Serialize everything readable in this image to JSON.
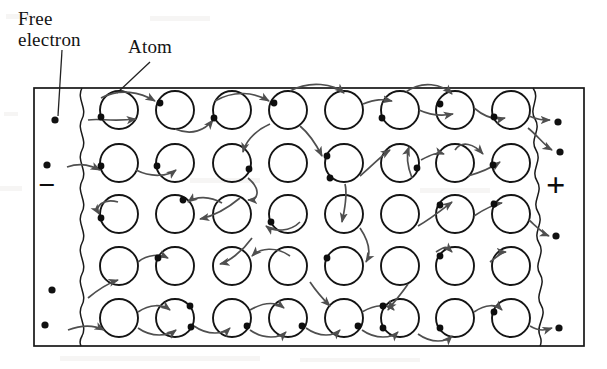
{
  "labels": {
    "free_electron": "Free\nelectron",
    "free_electron_line1": "Free",
    "free_electron_line2": "electron",
    "atom": "Atom"
  },
  "terminals": {
    "negative": "−",
    "positive": "+",
    "negative_name": "negative terminal",
    "positive_name": "positive terminal"
  },
  "colors": {
    "ink": "#141414",
    "line": "#1a1a1a",
    "arrow": "#4c4c4c",
    "background": "#ffffff",
    "paper_noise": "#b9b5ad"
  },
  "geometry": {
    "canvas": {
      "width": 607,
      "height": 369
    },
    "box": {
      "x": 34,
      "y": 88,
      "width": 550,
      "height": 258
    },
    "atom_radius": 19,
    "rows": 5,
    "columns": 8,
    "row_y": [
      110,
      163,
      214,
      266,
      318
    ],
    "col_x": [
      119,
      175,
      232,
      288,
      344,
      400,
      455,
      511
    ],
    "wavy_boundary_left_x": 82,
    "wavy_boundary_right_x": 535
  },
  "lattice": {
    "atom_count": 40,
    "atoms": [
      {
        "row": 0,
        "col": 0,
        "cx": 119,
        "cy": 110,
        "electron_angle": 200
      },
      {
        "row": 0,
        "col": 1,
        "cx": 175,
        "cy": 110,
        "electron_angle": 250
      },
      {
        "row": 0,
        "col": 2,
        "cx": 232,
        "cy": 110,
        "electron_angle": 200
      },
      {
        "row": 0,
        "col": 3,
        "cx": 288,
        "cy": 110,
        "electron_angle": 260
      },
      {
        "row": 0,
        "col": 4,
        "cx": 344,
        "cy": 110,
        "electron_angle": null
      },
      {
        "row": 0,
        "col": 5,
        "cx": 400,
        "cy": 110,
        "electron_angle": 205
      },
      {
        "row": 0,
        "col": 6,
        "cx": 455,
        "cy": 110,
        "electron_angle": 255
      },
      {
        "row": 0,
        "col": 7,
        "cx": 511,
        "cy": 110,
        "electron_angle": 195
      },
      {
        "row": 1,
        "col": 0,
        "cx": 119,
        "cy": 163,
        "electron_angle": 190
      },
      {
        "row": 1,
        "col": 1,
        "cx": 175,
        "cy": 163,
        "electron_angle": 190
      },
      {
        "row": 1,
        "col": 2,
        "cx": 232,
        "cy": 163,
        "electron_angle": 20
      },
      {
        "row": 1,
        "col": 3,
        "cx": 288,
        "cy": 163,
        "electron_angle": null
      },
      {
        "row": 1,
        "col": 4,
        "cx": 344,
        "cy": 163,
        "electron_angle": 160
      },
      {
        "row": 1,
        "col": 5,
        "cx": 400,
        "cy": 163,
        "electron_angle": 340
      },
      {
        "row": 1,
        "col": 6,
        "cx": 455,
        "cy": 163,
        "electron_angle": null
      },
      {
        "row": 1,
        "col": 7,
        "cx": 511,
        "cy": 163,
        "electron_angle": 185
      },
      {
        "row": 2,
        "col": 0,
        "cx": 119,
        "cy": 214,
        "electron_angle": 195
      },
      {
        "row": 2,
        "col": 1,
        "cx": 175,
        "cy": 214,
        "electron_angle": 290
      },
      {
        "row": 2,
        "col": 2,
        "cx": 232,
        "cy": 214,
        "electron_angle": null
      },
      {
        "row": 2,
        "col": 3,
        "cx": 288,
        "cy": 214,
        "electron_angle": 250
      },
      {
        "row": 2,
        "col": 4,
        "cx": 344,
        "cy": 214,
        "electron_angle": null
      },
      {
        "row": 2,
        "col": 5,
        "cx": 400,
        "cy": 214,
        "electron_angle": null
      },
      {
        "row": 2,
        "col": 6,
        "cx": 455,
        "cy": 214,
        "electron_angle": 215
      },
      {
        "row": 2,
        "col": 7,
        "cx": 511,
        "cy": 214,
        "electron_angle": 210
      },
      {
        "row": 3,
        "col": 0,
        "cx": 119,
        "cy": 266,
        "electron_angle": null
      },
      {
        "row": 3,
        "col": 1,
        "cx": 175,
        "cy": 266,
        "electron_angle": 200
      },
      {
        "row": 3,
        "col": 2,
        "cx": 232,
        "cy": 266,
        "electron_angle": null
      },
      {
        "row": 3,
        "col": 3,
        "cx": 288,
        "cy": 266,
        "electron_angle": null
      },
      {
        "row": 3,
        "col": 4,
        "cx": 344,
        "cy": 266,
        "electron_angle": 195
      },
      {
        "row": 3,
        "col": 5,
        "cx": 400,
        "cy": 266,
        "electron_angle": null
      },
      {
        "row": 3,
        "col": 6,
        "cx": 455,
        "cy": 266,
        "electron_angle": null
      },
      {
        "row": 3,
        "col": 7,
        "cx": 511,
        "cy": 266,
        "electron_angle": null
      },
      {
        "row": 4,
        "col": 0,
        "cx": 119,
        "cy": 318,
        "electron_angle": null
      },
      {
        "row": 4,
        "col": 1,
        "cx": 175,
        "cy": 318,
        "electron_angle": 160
      },
      {
        "row": 4,
        "col": 2,
        "cx": 232,
        "cy": 318,
        "electron_angle": 200
      },
      {
        "row": 4,
        "col": 3,
        "cx": 288,
        "cy": 318,
        "electron_angle": 200
      },
      {
        "row": 4,
        "col": 4,
        "cx": 344,
        "cy": 318,
        "electron_angle": 195
      },
      {
        "row": 4,
        "col": 5,
        "cx": 400,
        "cy": 318,
        "electron_angle": 185
      },
      {
        "row": 4,
        "col": 6,
        "cx": 455,
        "cy": 318,
        "electron_angle": 200
      },
      {
        "row": 4,
        "col": 7,
        "cx": 511,
        "cy": 318,
        "electron_angle": 195
      }
    ]
  },
  "free_electrons": {
    "left": [
      {
        "cx": 55,
        "cy": 120
      },
      {
        "cx": 47,
        "cy": 165
      },
      {
        "cx": 52,
        "cy": 290
      },
      {
        "cx": 45,
        "cy": 325
      }
    ],
    "right": [
      {
        "cx": 558,
        "cy": 122
      },
      {
        "cx": 560,
        "cy": 152
      },
      {
        "cx": 556,
        "cy": 236
      },
      {
        "cx": 559,
        "cy": 328
      }
    ]
  },
  "leader_lines": [
    {
      "name": "free-electron-leader",
      "x1": 62,
      "y1": 50,
      "x2": 58,
      "y2": 116
    },
    {
      "name": "atom-leader",
      "x1": 148,
      "y1": 62,
      "x2": 118,
      "y2": 93
    }
  ],
  "drift_arrows": {
    "count": 34,
    "direction": "left-to-right (negative terminal toward positive terminal)",
    "note": "Curved arrows hop electron-by-electron between adjacent atoms"
  }
}
